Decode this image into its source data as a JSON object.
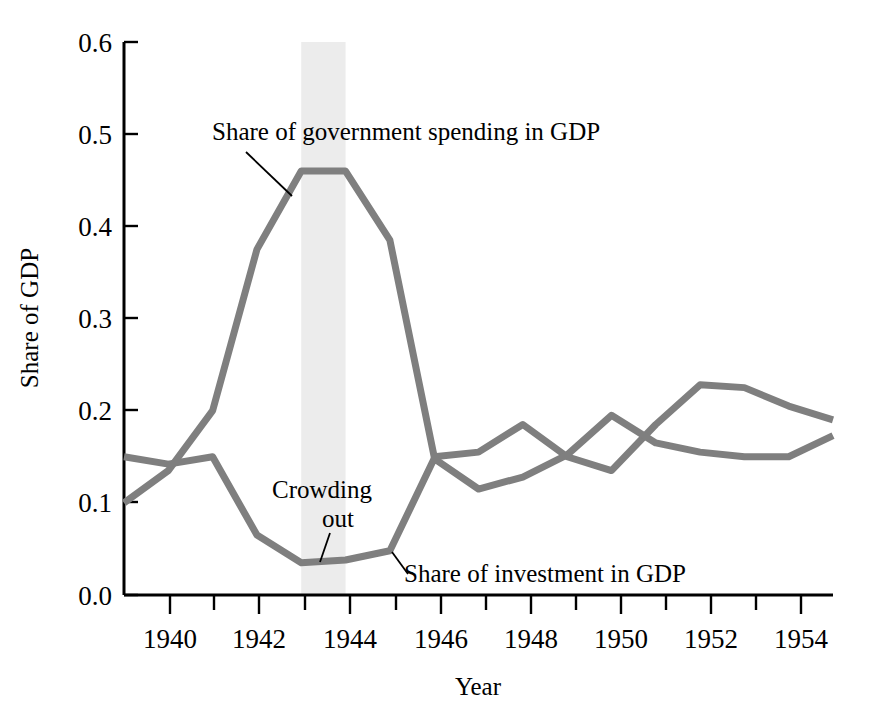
{
  "chart_data": {
    "type": "line",
    "title": "",
    "xlabel": "Year",
    "ylabel": "Share of GDP",
    "xlim": [
      1939,
      1955
    ],
    "ylim": [
      0.0,
      0.6
    ],
    "grid": false,
    "legend_position": "inline-annotations",
    "x": [
      1939,
      1940,
      1941,
      1942,
      1943,
      1944,
      1945,
      1946,
      1947,
      1948,
      1949,
      1950,
      1951,
      1952,
      1953,
      1954,
      1955
    ],
    "x_tick_labels": [
      "1940",
      "1942",
      "1944",
      "1946",
      "1948",
      "1950",
      "1952",
      "1954"
    ],
    "x_tick_values": [
      1940,
      1942,
      1944,
      1946,
      1948,
      1950,
      1952,
      1954
    ],
    "x_minor_ticks": [
      1940,
      1941,
      1942,
      1943,
      1944,
      1945,
      1946,
      1947,
      1948,
      1949,
      1950,
      1951,
      1952,
      1953,
      1954
    ],
    "y_tick_labels": [
      "0.0",
      "0.1",
      "0.2",
      "0.3",
      "0.4",
      "0.5",
      "0.6"
    ],
    "y_tick_values": [
      0.0,
      0.1,
      0.2,
      0.3,
      0.4,
      0.5,
      0.6
    ],
    "series": [
      {
        "name": "Share of government spending in GDP",
        "color": "#7f7f7f",
        "values": [
          0.1,
          0.135,
          0.2,
          0.375,
          0.46,
          0.46,
          0.385,
          0.15,
          0.155,
          0.185,
          0.15,
          0.135,
          0.185,
          0.228,
          0.225,
          0.205,
          0.19
        ]
      },
      {
        "name": "Share of investment in GDP",
        "color": "#7f7f7f",
        "values": [
          0.15,
          0.142,
          0.15,
          0.065,
          0.035,
          0.038,
          0.048,
          0.148,
          0.115,
          0.128,
          0.152,
          0.195,
          0.165,
          0.155,
          0.15,
          0.15,
          0.173
        ]
      }
    ],
    "shaded_band": {
      "label": "Crowding out",
      "x_start": 1943,
      "x_end": 1944,
      "color": "#ececec"
    },
    "annotations": [
      {
        "id": "gov-label",
        "text": "Share of government spending in GDP",
        "x": 1942.0,
        "y": 0.5
      },
      {
        "id": "inv-label",
        "text": "Share of investment in GDP",
        "x": 1947.2,
        "y": 0.04
      },
      {
        "id": "crowd-line1",
        "text": "Crowding",
        "x": 1943.2,
        "y": 0.105
      },
      {
        "id": "crowd-line2",
        "text": "out",
        "x": 1943.4,
        "y": 0.075
      }
    ]
  },
  "axes": {
    "y_title": "Share of GDP",
    "x_title": "Year"
  },
  "labels": {
    "y_0_0": "0.0",
    "y_0_1": "0.1",
    "y_0_2": "0.2",
    "y_0_3": "0.3",
    "y_0_4": "0.4",
    "y_0_5": "0.5",
    "y_0_6": "0.6",
    "x_1940": "1940",
    "x_1942": "1942",
    "x_1944": "1944",
    "x_1946": "1946",
    "x_1948": "1948",
    "x_1950": "1950",
    "x_1952": "1952",
    "x_1954": "1954"
  },
  "annotations": {
    "gov_series_label": "Share of government spending in GDP",
    "inv_series_label": "Share of investment in GDP",
    "crowding_line1": "Crowding",
    "crowding_line2": "out"
  }
}
